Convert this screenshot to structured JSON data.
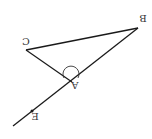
{
  "diagram": {
    "orientation": "rotated-180",
    "colors": {
      "stroke": "#1a1a1a",
      "label": "#333333",
      "background": "#ffffff"
    },
    "points": {
      "A": {
        "label": "A",
        "x": 72,
        "y": 82
      },
      "B": {
        "label": "B",
        "x": 138,
        "y": 28
      },
      "C": {
        "label": "C",
        "x": 26,
        "y": 50
      },
      "E": {
        "label": "E",
        "x": 32,
        "y": 111
      }
    },
    "segments": [
      "BC",
      "CA",
      "BA",
      "A-extended-through-E"
    ],
    "angle_marker": {
      "at": "A",
      "type": "arc"
    }
  }
}
